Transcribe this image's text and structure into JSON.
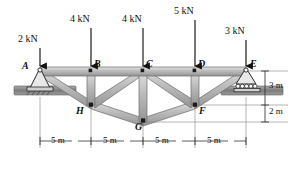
{
  "figure": {
    "type": "truss-free-body-diagram"
  },
  "geometry": {
    "units": "m",
    "top_chord_nodes": [
      "A",
      "B",
      "C",
      "D",
      "E"
    ],
    "bottom_nodes": [
      "H",
      "G",
      "F"
    ],
    "panel_length": "5 m",
    "depth_upper": "3 m",
    "depth_lower": "2 m"
  },
  "nodes": [
    {
      "id": "A",
      "label": "A",
      "x": 40,
      "y": 71,
      "lx": 24,
      "ly": 62,
      "kind": "pin-support"
    },
    {
      "id": "B",
      "label": "B",
      "x": 91,
      "y": 71,
      "lx": 94,
      "ly": 60,
      "kind": "joint"
    },
    {
      "id": "C",
      "label": "C",
      "x": 143,
      "y": 71,
      "lx": 146,
      "ly": 60,
      "kind": "joint"
    },
    {
      "id": "D",
      "label": "D",
      "x": 195,
      "y": 71,
      "lx": 198,
      "ly": 60,
      "kind": "joint"
    },
    {
      "id": "E",
      "label": "E",
      "x": 246,
      "y": 71,
      "lx": 250,
      "ly": 60,
      "kind": "roller-support"
    },
    {
      "id": "H",
      "label": "H",
      "x": 91,
      "y": 105,
      "lx": 78,
      "ly": 106,
      "kind": "joint"
    },
    {
      "id": "G",
      "label": "G",
      "x": 143,
      "y": 122,
      "lx": 137,
      "ly": 122,
      "kind": "joint"
    },
    {
      "id": "F",
      "label": "F",
      "x": 195,
      "y": 105,
      "lx": 198,
      "ly": 106,
      "kind": "joint"
    }
  ],
  "members": [
    {
      "from": "A",
      "to": "B",
      "chord": "top"
    },
    {
      "from": "B",
      "to": "C",
      "chord": "top"
    },
    {
      "from": "C",
      "to": "D",
      "chord": "top"
    },
    {
      "from": "D",
      "to": "E",
      "chord": "top"
    },
    {
      "from": "A",
      "to": "H",
      "chord": "diagonal"
    },
    {
      "from": "B",
      "to": "H",
      "chord": "vertical"
    },
    {
      "from": "C",
      "to": "H",
      "chord": "diagonal"
    },
    {
      "from": "H",
      "to": "G",
      "chord": "bottom"
    },
    {
      "from": "C",
      "to": "G",
      "chord": "vertical"
    },
    {
      "from": "G",
      "to": "F",
      "chord": "bottom"
    },
    {
      "from": "C",
      "to": "F",
      "chord": "diagonal"
    },
    {
      "from": "D",
      "to": "F",
      "chord": "vertical"
    },
    {
      "from": "E",
      "to": "F",
      "chord": "diagonal"
    }
  ],
  "loads": [
    {
      "id": "load-a",
      "label": "2 kN",
      "node": "A",
      "tx": 18,
      "ty": 34,
      "ax": 40,
      "ay_top": 48,
      "ay_bot": 69
    },
    {
      "id": "load-b",
      "label": "4 kN",
      "node": "B",
      "tx": 70,
      "ty": 14,
      "ax": 91,
      "ay_top": 28,
      "ay_bot": 69
    },
    {
      "id": "load-c",
      "label": "4 kN",
      "node": "C",
      "tx": 122,
      "ty": 14,
      "ax": 143,
      "ay_top": 28,
      "ay_bot": 69
    },
    {
      "id": "load-d",
      "label": "5 kN",
      "node": "D",
      "tx": 174,
      "ty": 6,
      "ax": 195,
      "ay_top": 20,
      "ay_bot": 69
    },
    {
      "id": "load-e",
      "label": "3 kN",
      "node": "E",
      "tx": 226,
      "ty": 26,
      "ax": 246,
      "ay_top": 40,
      "ay_bot": 69
    }
  ],
  "dimensions": {
    "horizontal": [
      {
        "id": "span-1",
        "label": "5 m",
        "x1": 40,
        "x2": 91,
        "tx": 52,
        "ty": 142
      },
      {
        "id": "span-2",
        "label": "5 m",
        "x1": 91,
        "x2": 143,
        "tx": 104,
        "ty": 142
      },
      {
        "id": "span-3",
        "label": "5 m",
        "x1": 143,
        "x2": 195,
        "tx": 156,
        "ty": 142
      },
      {
        "id": "span-4",
        "label": "5 m",
        "x1": 195,
        "x2": 246,
        "tx": 208,
        "ty": 142
      }
    ],
    "vertical": [
      {
        "id": "height-3m",
        "label": "3 m",
        "tx": 268,
        "ty": 79,
        "y1": 71,
        "y2": 105
      },
      {
        "id": "height-2m",
        "label": "2 m",
        "tx": 268,
        "ty": 107,
        "y1": 105,
        "y2": 122
      }
    ]
  },
  "colors": {
    "member_fill": "#b9b9b9",
    "member_edge": "#6e6e6e",
    "member_highlight": "#d8d8d8",
    "ground_fill": "#8a8a8a",
    "ink": "#111111",
    "dim_line": "#8d8d8d"
  }
}
